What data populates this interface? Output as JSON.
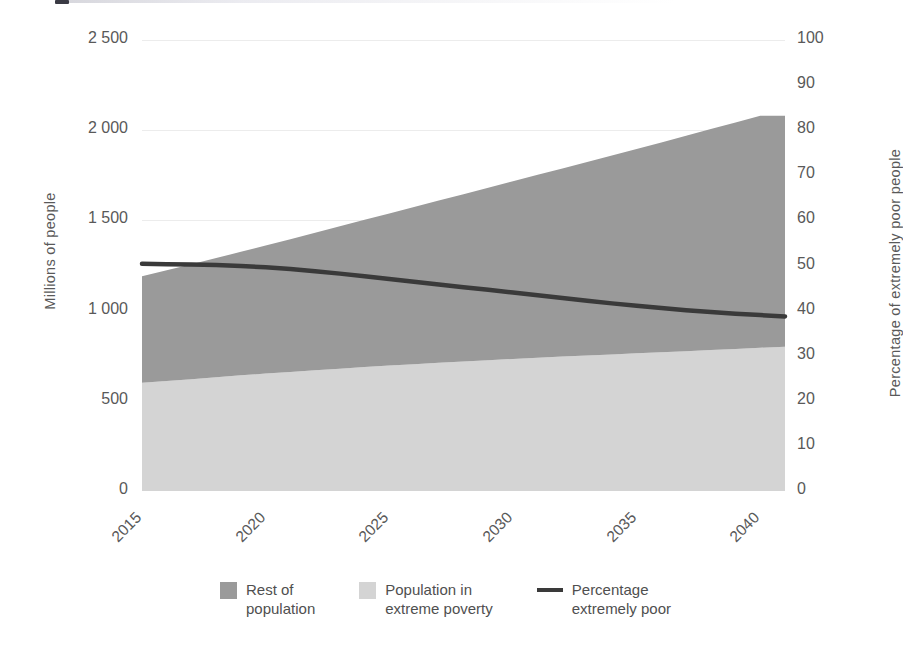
{
  "chart_data": {
    "type": "area",
    "title": "",
    "subtitle": "",
    "xlabel": "",
    "ylabel": "Millions of people",
    "y2label": "Percentage of extremely poor people",
    "x": [
      2015,
      2016,
      2017,
      2018,
      2019,
      2020,
      2021,
      2022,
      2023,
      2024,
      2025,
      2026,
      2027,
      2028,
      2029,
      2030,
      2031,
      2032,
      2033,
      2034,
      2035,
      2036,
      2037,
      2038,
      2039,
      2040,
      2041
    ],
    "xlim": [
      2015,
      2041
    ],
    "ylim": [
      0,
      2500
    ],
    "y2lim": [
      0,
      100
    ],
    "xticks": [
      "2015",
      "2020",
      "2025",
      "2030",
      "2035",
      "2040"
    ],
    "xtick_values": [
      2015,
      2020,
      2025,
      2030,
      2035,
      2040
    ],
    "yticks": [
      "0",
      "500",
      "1 000",
      "1 500",
      "2 000",
      "2 500"
    ],
    "ytick_values": [
      0,
      500,
      1000,
      1500,
      2000,
      2500
    ],
    "y2ticks": [
      "0",
      "10",
      "20",
      "30",
      "40",
      "50",
      "60",
      "70",
      "80",
      "90",
      "100"
    ],
    "y2tick_values": [
      0,
      10,
      20,
      30,
      40,
      50,
      60,
      70,
      80,
      90,
      100
    ],
    "grid": true,
    "grid_axis": "y",
    "legend_position": "bottom",
    "stacked": true,
    "series": [
      {
        "name": "Population in extreme poverty",
        "type": "area",
        "axis": "left",
        "color": "#d4d4d4",
        "values": [
          600,
          610,
          620,
          630,
          641,
          651,
          660,
          669,
          678,
          687,
          695,
          703,
          711,
          718,
          725,
          732,
          739,
          745,
          751,
          757,
          763,
          769,
          775,
          781,
          787,
          794,
          800
        ]
      },
      {
        "name": "Rest of population",
        "type": "area",
        "axis": "left",
        "color": "#9a9a9a",
        "values": [
          590,
          613,
          637,
          661,
          685,
          710,
          736,
          762,
          789,
          816,
          843,
          871,
          899,
          927,
          956,
          985,
          1014,
          1043,
          1073,
          1103,
          1133,
          1163,
          1194,
          1225,
          1256,
          1286,
          1280
        ]
      },
      {
        "name": "Percentage extremely poor",
        "type": "line",
        "axis": "right",
        "color": "#3a3a3a",
        "values": [
          50.4,
          50.3,
          50.2,
          50.1,
          49.9,
          49.6,
          49.2,
          48.7,
          48.2,
          47.6,
          47.0,
          46.4,
          45.8,
          45.2,
          44.6,
          44.0,
          43.4,
          42.8,
          42.2,
          41.6,
          41.1,
          40.6,
          40.1,
          39.7,
          39.3,
          39.0,
          38.7
        ]
      }
    ],
    "total_population": [
      1190,
      1223,
      1257,
      1291,
      1326,
      1361,
      1396,
      1431,
      1467,
      1503,
      1538,
      1574,
      1610,
      1645,
      1681,
      1717,
      1753,
      1788,
      1824,
      1860,
      1896,
      1932,
      1969,
      2006,
      2043,
      2080,
      2080
    ]
  },
  "legend": {
    "items": [
      {
        "label": "Rest of\npopulation",
        "marker": "swatch",
        "color": "#9a9a9a"
      },
      {
        "label": "Population in\nextreme poverty",
        "marker": "swatch",
        "color": "#d4d4d4"
      },
      {
        "label": "Percentage\nextremely poor",
        "marker": "line",
        "color": "#3a3a3a"
      }
    ]
  },
  "axes": {
    "left_title": "Millions of people",
    "right_title": "Percentage of extremely poor people"
  },
  "colors": {
    "rest_of_population": "#9a9a9a",
    "extreme_poverty": "#d4d4d4",
    "percentage_line": "#3a3a3a",
    "grid": "#ececec",
    "text": "#595959",
    "background": "#ffffff"
  }
}
